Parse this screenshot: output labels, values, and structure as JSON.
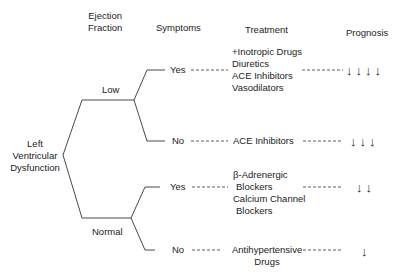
{
  "headers": {
    "ejection_fraction": [
      "Ejection",
      "Fraction"
    ],
    "symptoms": "Symptoms",
    "treatment": "Treatment",
    "prognosis": "Prognosis"
  },
  "root": [
    "Left",
    "Ventricular",
    "Dysfunction"
  ],
  "branches": {
    "low": {
      "label": "Low",
      "yes": {
        "label": "Yes",
        "treatment": [
          "+Inotropic Drugs",
          "Diuretics",
          "ACE Inhibitors",
          "Vasodilators"
        ],
        "prognosis": "↓↓↓↓"
      },
      "no": {
        "label": "No",
        "treatment": [
          "ACE Inhibitors"
        ],
        "prognosis": "↓↓↓"
      }
    },
    "normal": {
      "label": "Normal",
      "yes": {
        "label": "Yes",
        "treatment": [
          "β-Adrenergic",
          "Blockers",
          "Calcium Channel",
          "Blockers"
        ],
        "prognosis": "↓↓"
      },
      "no": {
        "label": "No",
        "treatment": [
          "Antihypertensive",
          "Drugs"
        ],
        "prognosis": "↓"
      }
    }
  },
  "colors": {
    "line": "#333333",
    "text": "#222222"
  }
}
